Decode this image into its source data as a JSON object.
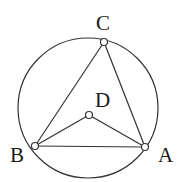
{
  "diagram": {
    "type": "geometry",
    "circle": {
      "cx": 88,
      "cy": 108,
      "r": 70
    },
    "points": {
      "A": {
        "x": 145,
        "y": 147,
        "label": "A",
        "lx": 158,
        "ly": 162
      },
      "B": {
        "x": 35,
        "y": 146,
        "label": "B",
        "lx": 10,
        "ly": 162
      },
      "C": {
        "x": 104,
        "y": 42,
        "label": "C",
        "lx": 96,
        "ly": 30
      },
      "D": {
        "x": 89,
        "y": 115,
        "label": "D",
        "lx": 95,
        "ly": 107
      }
    },
    "segments": [
      [
        "A",
        "B"
      ],
      [
        "B",
        "C"
      ],
      [
        "C",
        "A"
      ],
      [
        "B",
        "D"
      ],
      [
        "D",
        "A"
      ]
    ],
    "colors": {
      "stroke": "#333333",
      "point_fill": "#ffffff"
    }
  }
}
